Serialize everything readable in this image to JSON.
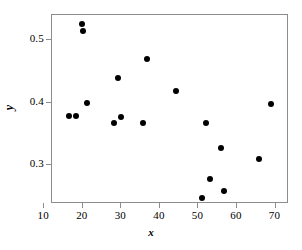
{
  "chart_data": {
    "type": "scatter",
    "title": "",
    "xlabel": "x",
    "ylabel": "y",
    "xlim": [
      12.0,
      73.5
    ],
    "ylim": [
      0.238,
      0.54
    ],
    "grid": false,
    "legend": null,
    "xticks": [
      10,
      20,
      30,
      40,
      50,
      60,
      70
    ],
    "xticklabels": [
      "10",
      "20",
      "30",
      "40",
      "50",
      "60",
      "70"
    ],
    "yticks": [
      0.3,
      0.4,
      0.5
    ],
    "yticklabels": [
      "0.3",
      "0.4",
      "0.5"
    ],
    "marker": "filled-circle",
    "marker_color": "#000000",
    "marker_size_px": 6,
    "points": [
      {
        "x": 19.8,
        "y": 0.526
      },
      {
        "x": 20.0,
        "y": 0.514
      },
      {
        "x": 36.7,
        "y": 0.47
      },
      {
        "x": 29.1,
        "y": 0.44
      },
      {
        "x": 44.3,
        "y": 0.418
      },
      {
        "x": 21.0,
        "y": 0.4
      },
      {
        "x": 68.8,
        "y": 0.398
      },
      {
        "x": 16.3,
        "y": 0.378
      },
      {
        "x": 18.1,
        "y": 0.378
      },
      {
        "x": 29.9,
        "y": 0.377
      },
      {
        "x": 28.0,
        "y": 0.368
      },
      {
        "x": 35.7,
        "y": 0.368
      },
      {
        "x": 51.9,
        "y": 0.368
      },
      {
        "x": 55.8,
        "y": 0.328
      },
      {
        "x": 65.6,
        "y": 0.31
      },
      {
        "x": 53.0,
        "y": 0.278
      },
      {
        "x": 56.7,
        "y": 0.258
      },
      {
        "x": 50.9,
        "y": 0.248
      }
    ]
  },
  "axes": {
    "frame_color": "#8c8c8c",
    "background": "#ffffff"
  }
}
